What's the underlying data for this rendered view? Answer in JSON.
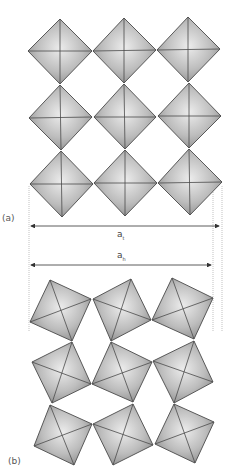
{
  "figure": {
    "panels": [
      {
        "id": "a",
        "label": "(a)",
        "description": "Untilted corner-sharing octahedra, 3x3 grid",
        "octahedra": [
          {
            "row": 1,
            "col": 1,
            "pts": [
              [
                60,
                19
              ],
              [
                92,
                51
              ],
              [
                60,
                84
              ],
              [
                28,
                51
              ]
            ]
          },
          {
            "row": 1,
            "col": 2,
            "pts": [
              [
                124,
                18
              ],
              [
                156,
                50
              ],
              [
                124,
                83
              ],
              [
                93,
                51
              ]
            ]
          },
          {
            "row": 1,
            "col": 3,
            "pts": [
              [
                188,
                17
              ],
              [
                220,
                49
              ],
              [
                188,
                82
              ],
              [
                157,
                50
              ]
            ]
          },
          {
            "row": 2,
            "col": 1,
            "pts": [
              [
                60,
                85
              ],
              [
                92,
                117
              ],
              [
                61,
                150
              ],
              [
                29,
                118
              ]
            ]
          },
          {
            "row": 2,
            "col": 2,
            "pts": [
              [
                124,
                84
              ],
              [
                156,
                117
              ],
              [
                125,
                149
              ],
              [
                94,
                117
              ]
            ]
          },
          {
            "row": 2,
            "col": 3,
            "pts": [
              [
                189,
                83
              ],
              [
                221,
                116
              ],
              [
                189,
                148
              ],
              [
                158,
                116
              ]
            ]
          },
          {
            "row": 3,
            "col": 1,
            "pts": [
              [
                61,
                151
              ],
              [
                93,
                184
              ],
              [
                62,
                217
              ],
              [
                30,
                184
              ]
            ]
          },
          {
            "row": 3,
            "col": 2,
            "pts": [
              [
                125,
                150
              ],
              [
                157,
                183
              ],
              [
                125,
                216
              ],
              [
                94,
                183
              ]
            ]
          },
          {
            "row": 3,
            "col": 3,
            "pts": [
              [
                189,
                149
              ],
              [
                222,
                182
              ],
              [
                190,
                215
              ],
              [
                158,
                183
              ]
            ]
          }
        ]
      },
      {
        "id": "b",
        "label": "(b)",
        "description": "Tilted corner-sharing octahedra, 3x3 grid",
        "octahedra": [
          {
            "row": 1,
            "col": 1,
            "pts": [
              [
                50,
                280
              ],
              [
                91,
                299
              ],
              [
                72,
                341
              ],
              [
                30,
                322
              ]
            ]
          },
          {
            "row": 1,
            "col": 2,
            "pts": [
              [
                93,
                299
              ],
              [
                131,
                279
              ],
              [
                151,
                320
              ],
              [
                111,
                341
              ]
            ]
          },
          {
            "row": 1,
            "col": 3,
            "pts": [
              [
                172,
                278
              ],
              [
                213,
                298
              ],
              [
                194,
                339
              ],
              [
                152,
                320
              ]
            ]
          },
          {
            "row": 2,
            "col": 1,
            "pts": [
              [
                32,
                362
              ],
              [
                72,
                342
              ],
              [
                91,
                384
              ],
              [
                52,
                403
              ]
            ]
          },
          {
            "row": 2,
            "col": 2,
            "pts": [
              [
                111,
                342
              ],
              [
                152,
                362
              ],
              [
                133,
                402
              ],
              [
                92,
                384
              ]
            ]
          },
          {
            "row": 2,
            "col": 3,
            "pts": [
              [
                153,
                361
              ],
              [
                194,
                341
              ],
              [
                213,
                382
              ],
              [
                174,
                403
              ]
            ]
          },
          {
            "row": 3,
            "col": 1,
            "pts": [
              [
                50,
                405
              ],
              [
                92,
                424
              ],
              [
                74,
                465
              ],
              [
                34,
                446
              ]
            ]
          },
          {
            "row": 3,
            "col": 2,
            "pts": [
              [
                93,
                424
              ],
              [
                133,
                404
              ],
              [
                153,
                445
              ],
              [
                113,
                465
              ]
            ]
          },
          {
            "row": 3,
            "col": 3,
            "pts": [
              [
                174,
                404
              ],
              [
                214,
                422
              ],
              [
                195,
                463
              ],
              [
                155,
                444
              ]
            ]
          }
        ]
      }
    ],
    "dimensions": [
      {
        "id": "a_t",
        "symbol": "a",
        "subscript": "t",
        "x1": 29,
        "x2": 221,
        "y": 226,
        "label_x": 118,
        "label_y": 232
      },
      {
        "id": "a_h",
        "symbol": "a",
        "subscript": "h",
        "x1": 29,
        "x2": 213,
        "y": 265,
        "label_x": 118,
        "label_y": 247
      }
    ],
    "guides": [
      {
        "x": 29,
        "y1": 186,
        "y2": 332
      },
      {
        "x": 213,
        "y1": 186,
        "y2": 332
      },
      {
        "x": 222,
        "y1": 186,
        "y2": 332
      }
    ],
    "colors": {
      "face_light": "#e8e8e8",
      "face_mid": "#b8b8b8",
      "face_dark": "#8c8c8c",
      "edge": "#4a4a4a",
      "dim_line": "#333333",
      "guide": "#999999"
    }
  },
  "labels": {
    "panel_a": "(a)",
    "panel_b": "(b)",
    "a_t_symbol": "a",
    "a_t_sub": "t",
    "a_h_symbol": "a",
    "a_h_sub": "h"
  }
}
